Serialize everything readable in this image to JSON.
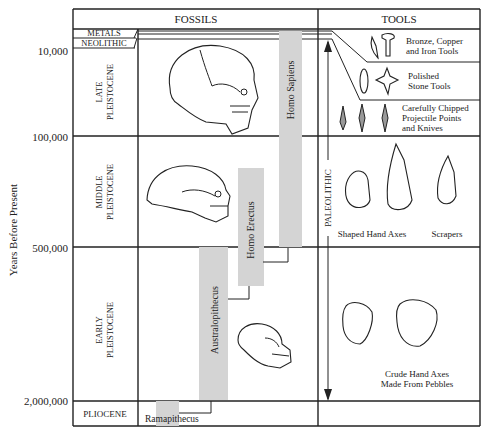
{
  "headers": {
    "fossils": "FOSSILS",
    "tools": "TOOLS"
  },
  "y_axis": {
    "label": "Years Before Present",
    "ticks": [
      "10,000",
      "100,000",
      "500,000",
      "2,000,000"
    ]
  },
  "periods": {
    "metals": "METALS",
    "neolithic": "NEOLITHIC",
    "late_1": "LATE",
    "late_2": "PLEISTOCENE",
    "middle_1": "MIDDLE",
    "middle_2": "PLEISTOCENE",
    "early_1": "EARLY",
    "early_2": "PLEISTOCENE",
    "pliocene": "PLIOCENE"
  },
  "species": {
    "homo_sapiens": "Homo Sapiens",
    "homo_erectus": "Homo Erectus",
    "australopithecus": "Australopithecus",
    "ramapithecus": "Ramapithecus"
  },
  "paleolithic_label": "PALEOLITHIC",
  "tools": {
    "bronze_1": "Bronze, Copper",
    "bronze_2": "and Iron Tools",
    "polished_1": "Polished",
    "polished_2": "Stone Tools",
    "chipped_1": "Carefully Chipped",
    "chipped_2": "Projectile Points",
    "chipped_3": "and Knives",
    "shaped": "Shaped Hand Axes",
    "scrapers": "Scrapers",
    "crude_1": "Crude Hand Axes",
    "crude_2": "Made From Pebbles"
  },
  "colors": {
    "ink": "#222222",
    "bar": "#d4d4d4"
  }
}
